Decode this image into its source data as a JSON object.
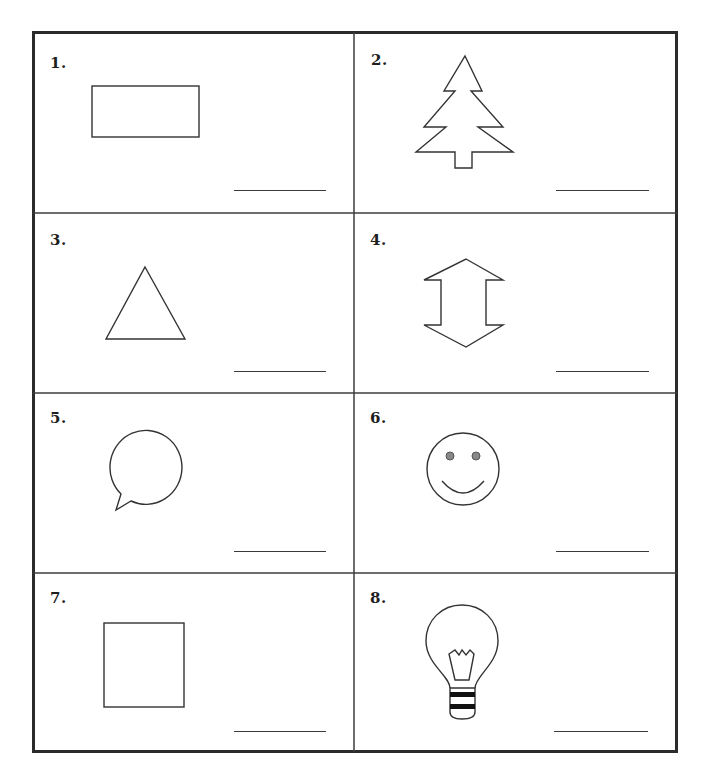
{
  "worksheet": {
    "columns": 2,
    "rows": 4,
    "items": [
      {
        "number": "1.",
        "shape": "rectangle-icon",
        "answer": ""
      },
      {
        "number": "2.",
        "shape": "tree-icon",
        "answer": ""
      },
      {
        "number": "3.",
        "shape": "triangle-icon",
        "answer": ""
      },
      {
        "number": "4.",
        "shape": "double-arrow-icon",
        "answer": ""
      },
      {
        "number": "5.",
        "shape": "speech-bubble-icon",
        "answer": ""
      },
      {
        "number": "6.",
        "shape": "smiley-face-icon",
        "answer": ""
      },
      {
        "number": "7.",
        "shape": "square-icon",
        "answer": ""
      },
      {
        "number": "8.",
        "shape": "light-bulb-icon",
        "answer": ""
      }
    ]
  },
  "colors": {
    "border": "#2b2b2b",
    "stroke": "#333333",
    "eye_fill": "#888888",
    "background": "#ffffff"
  }
}
